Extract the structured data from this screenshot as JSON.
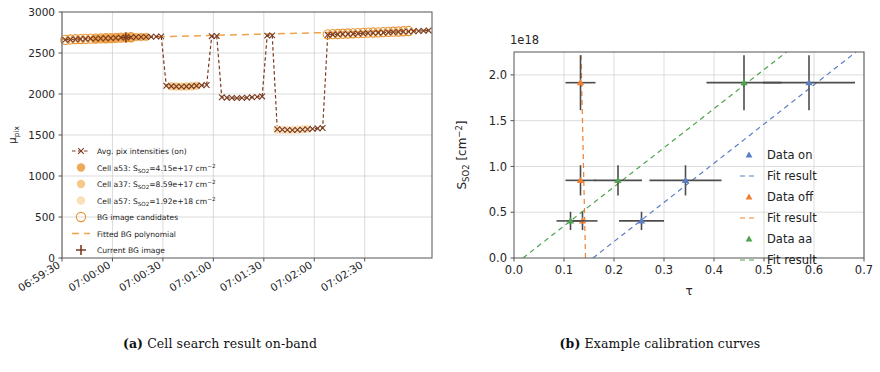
{
  "figure": {
    "panels": [
      {
        "id": "panel-a",
        "caption_tag": "(a)",
        "caption_text": "Cell search result on-band"
      },
      {
        "id": "panel-b",
        "caption_tag": "(b)",
        "caption_text": "Example calibration curves"
      }
    ]
  },
  "chart_data": [
    {
      "type": "line",
      "id": "cell-search-on-band",
      "title": "",
      "xlabel": "",
      "ylabel": "μ_pix",
      "ylabel_display": "μ",
      "ylabel_sub": "pix",
      "xlim": [
        0,
        220
      ],
      "ylim": [
        0,
        3000
      ],
      "yticks": [
        0,
        500,
        1000,
        1500,
        2000,
        2500,
        3000
      ],
      "ytick_labels": [
        "0",
        "500",
        "1000",
        "1500",
        "2000",
        "2500",
        "3000"
      ],
      "xticks": [
        0,
        30,
        60,
        90,
        120,
        150,
        180
      ],
      "xtick_labels": [
        "06:59:30",
        "07:00:00",
        "07:00:30",
        "07:01:00",
        "07:01:30",
        "07:02:00",
        "07:02:30"
      ],
      "grid": true,
      "legend_position": "lower left",
      "series": [
        {
          "name": "Avg. pix intensities (on)",
          "marker": "x",
          "linestyle": "dashed",
          "color": "#7a3b20",
          "x": [
            2,
            5,
            8,
            11,
            14,
            17,
            20,
            23,
            26,
            29,
            32,
            35,
            38,
            41,
            44,
            47,
            50,
            53,
            56,
            59,
            62,
            65,
            68,
            71,
            74,
            77,
            80,
            83,
            86,
            89,
            92,
            95,
            98,
            101,
            104,
            107,
            110,
            113,
            116,
            119,
            122,
            125,
            128,
            131,
            134,
            137,
            140,
            143,
            146,
            149,
            152,
            155,
            158,
            161,
            164,
            167,
            170,
            173,
            176,
            179,
            182,
            185,
            188,
            191,
            194,
            197,
            200,
            203,
            206,
            209,
            212,
            215,
            218
          ],
          "y": [
            2660,
            2665,
            2668,
            2670,
            2672,
            2675,
            2676,
            2678,
            2680,
            2682,
            2685,
            2688,
            2690,
            2692,
            2694,
            2695,
            2697,
            2698,
            2700,
            2702,
            2100,
            2095,
            2092,
            2090,
            2092,
            2095,
            2100,
            2105,
            2110,
            2705,
            2708,
            1960,
            1955,
            1952,
            1950,
            1952,
            1955,
            1960,
            1965,
            1970,
            2712,
            2715,
            1570,
            1565,
            1562,
            1560,
            1562,
            1565,
            1570,
            1575,
            1580,
            1585,
            2722,
            2725,
            2728,
            2730,
            2732,
            2735,
            2738,
            2740,
            2742,
            2745,
            2748,
            2750,
            2752,
            2755,
            2758,
            2760,
            2762,
            2765,
            2768,
            2770,
            2775
          ]
        },
        {
          "name": "Cell a53: S_SO2=4.15e+17 cm^-2",
          "label_prefix": "Cell a53: S",
          "label_sub": "SO2",
          "label_mid": "=4.15e+17 cm",
          "label_sup": "−2",
          "marker": "o",
          "color": "#edaa58",
          "x": [
            20,
            23,
            26,
            29,
            32,
            35,
            38,
            41,
            44,
            47,
            50
          ],
          "y": [
            2676,
            2678,
            2680,
            2682,
            2685,
            2688,
            2690,
            2692,
            2694,
            2695,
            2697
          ]
        },
        {
          "name": "Cell a37: S_SO2=8.59e+17 cm^-2",
          "label_prefix": "Cell a37: S",
          "label_sub": "SO2",
          "label_mid": "=8.59e+17 cm",
          "label_sup": "−2",
          "marker": "o",
          "color": "#f6c98a",
          "x": [
            65,
            68,
            71,
            74,
            77,
            80
          ],
          "y": [
            2095,
            2092,
            2090,
            2092,
            2095,
            2100
          ]
        },
        {
          "name": "Cell a57: S_SO2=1.92e+18 cm^-2",
          "label_prefix": "Cell a57: S",
          "label_sub": "SO2",
          "label_mid": "=1.92e+18 cm",
          "label_sup": "−2",
          "marker": "o",
          "color": "#fbdfb8",
          "x": [
            128,
            131,
            134,
            137,
            140,
            143,
            146
          ],
          "y": [
            1565,
            1562,
            1560,
            1562,
            1565,
            1570,
            1575
          ]
        },
        {
          "name": "BG image candidates",
          "marker": "o-open",
          "color": "#e8912f",
          "x": [
            2,
            5,
            8,
            11,
            14,
            17,
            20,
            23,
            26,
            29,
            32,
            35,
            38,
            41,
            158,
            161,
            164,
            167,
            170,
            173,
            176,
            179,
            182,
            185,
            188,
            191,
            194,
            197,
            200,
            203,
            206
          ],
          "y": [
            2660,
            2665,
            2668,
            2670,
            2672,
            2675,
            2676,
            2678,
            2680,
            2682,
            2685,
            2688,
            2690,
            2692,
            2728,
            2730,
            2732,
            2735,
            2738,
            2740,
            2742,
            2745,
            2748,
            2750,
            2752,
            2755,
            2758,
            2760,
            2762,
            2765,
            2768
          ]
        },
        {
          "name": "Fitted BG polynomial",
          "marker": "none",
          "linestyle": "dashed",
          "color": "#f0a24a",
          "x": [
            0,
            220
          ],
          "y": [
            2668,
            2782
          ]
        },
        {
          "name": "Current BG image",
          "marker": "plus",
          "color": "#7a3b20",
          "x": [
            38
          ],
          "y": [
            2690
          ]
        }
      ]
    },
    {
      "type": "scatter",
      "id": "example-calibration-curves",
      "title": "",
      "xlabel": "τ",
      "ylabel": "S_SO2 [cm^-2]",
      "ylabel_prefix": "S",
      "ylabel_sub": "SO2",
      "ylabel_suffix": " [cm",
      "ylabel_sup": "−2",
      "ylabel_end": "]",
      "y_offset_text": "1e18",
      "xlim": [
        0.0,
        0.7
      ],
      "ylim": [
        0.0,
        2.25
      ],
      "xticks": [
        0.0,
        0.1,
        0.2,
        0.3,
        0.4,
        0.5,
        0.6,
        0.7
      ],
      "xtick_labels": [
        "0.0",
        "0.1",
        "0.2",
        "0.3",
        "0.4",
        "0.5",
        "0.6",
        "0.7"
      ],
      "yticks": [
        0.0,
        0.5,
        1.0,
        1.5,
        2.0
      ],
      "ytick_labels": [
        "0.0",
        "0.5",
        "1.0",
        "1.5",
        "2.0"
      ],
      "grid": true,
      "legend_position": "center right",
      "errorbar_color": "#4d4d4d",
      "series": [
        {
          "name": "Data on",
          "kind": "points",
          "marker": "^",
          "color": "#5a7fc4",
          "points": [
            {
              "x": 0.255,
              "y": 0.405,
              "xerr": 0.045,
              "yerr": 0.1
            },
            {
              "x": 0.343,
              "y": 0.848,
              "xerr": 0.072,
              "yerr": 0.165
            },
            {
              "x": 0.59,
              "y": 1.915,
              "xerr": 0.092,
              "yerr": 0.3
            }
          ]
        },
        {
          "name": "Fit result",
          "kind": "line",
          "linestyle": "dashed",
          "color": "#5a7fc4",
          "x": [
            0.158,
            0.684
          ],
          "y": [
            0.0,
            2.25
          ]
        },
        {
          "name": "Data off",
          "kind": "points",
          "marker": "^",
          "color": "#f08030",
          "points": [
            {
              "x": 0.137,
              "y": 0.405,
              "xerr": 0.03,
              "yerr": 0.1
            },
            {
              "x": 0.133,
              "y": 0.848,
              "xerr": 0.03,
              "yerr": 0.165
            },
            {
              "x": 0.133,
              "y": 1.915,
              "xerr": 0.03,
              "yerr": 0.3
            }
          ]
        },
        {
          "name": "Fit result",
          "kind": "line",
          "linestyle": "dashed",
          "color": "#f08030",
          "x": [
            0.143,
            0.134
          ],
          "y": [
            0.0,
            2.25
          ]
        },
        {
          "name": "Data aa",
          "kind": "points",
          "marker": "^",
          "color": "#4fa34f",
          "points": [
            {
              "x": 0.113,
              "y": 0.405,
              "xerr": 0.028,
              "yerr": 0.1
            },
            {
              "x": 0.208,
              "y": 0.848,
              "xerr": 0.048,
              "yerr": 0.165
            },
            {
              "x": 0.46,
              "y": 1.915,
              "xerr": 0.075,
              "yerr": 0.3
            }
          ]
        },
        {
          "name": "Fit result",
          "kind": "line",
          "linestyle": "dashed",
          "color": "#4fa34f",
          "x": [
            0.018,
            0.545
          ],
          "y": [
            0.0,
            2.25
          ]
        }
      ]
    }
  ]
}
